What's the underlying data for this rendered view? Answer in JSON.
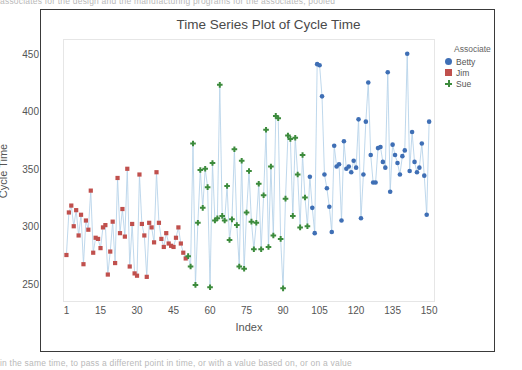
{
  "document": {
    "top_text_fragment": "associates for the design  and the manufacturing  programs  for  the  associates, pooled",
    "bottom_text_fragment": "in the same time,  to pass a different point in time, or with a value based on, or on a value"
  },
  "legend": {
    "title": "Associate",
    "entries": [
      {
        "label": "Betty",
        "color": "#3f6fb5",
        "marker": "circle-marker"
      },
      {
        "label": "Jim",
        "color": "#c0504d",
        "marker": "square-marker"
      },
      {
        "label": "Sue",
        "color": "#3c8b3c",
        "marker": "plus-marker"
      }
    ]
  },
  "chart_data": {
    "type": "line",
    "title": "Time Series Plot of Cycle Time",
    "xlabel": "Index",
    "ylabel": "Cycle Time",
    "xlim": [
      0,
      152
    ],
    "ylim": [
      235,
      462
    ],
    "xticks": [
      1,
      15,
      30,
      45,
      60,
      75,
      90,
      105,
      120,
      135,
      150
    ],
    "yticks": [
      250,
      300,
      350,
      400,
      450
    ],
    "grid": false,
    "legend_position": "right",
    "line_color": "#b8d4ea",
    "series": [
      {
        "name": "Jim",
        "color": "#c0504d",
        "marker": "square-marker",
        "x": [
          1,
          2,
          3,
          4,
          5,
          6,
          7,
          8,
          9,
          10,
          11,
          12,
          13,
          14,
          15,
          16,
          17,
          18,
          19,
          20,
          21,
          22,
          23,
          24,
          25,
          26,
          27,
          28,
          29,
          30,
          31,
          32,
          33,
          34,
          35,
          36,
          37,
          38,
          39,
          40,
          41,
          42,
          43,
          44,
          45,
          46,
          47,
          48,
          49,
          50
        ],
        "y": [
          275,
          312,
          318,
          300,
          314,
          292,
          310,
          267,
          305,
          297,
          331,
          277,
          290,
          289,
          281,
          299,
          301,
          258,
          278,
          304,
          268,
          342,
          294,
          315,
          291,
          350,
          265,
          302,
          259,
          257,
          345,
          302,
          292,
          256,
          303,
          299,
          286,
          347,
          303,
          289,
          282,
          294,
          285,
          283,
          282,
          290,
          299,
          285,
          277,
          272
        ]
      },
      {
        "name": "Sue",
        "color": "#3c8b3c",
        "marker": "plus-marker",
        "x": [
          51,
          52,
          53,
          54,
          55,
          56,
          57,
          58,
          59,
          60,
          61,
          62,
          63,
          64,
          65,
          66,
          67,
          68,
          69,
          70,
          71,
          72,
          73,
          74,
          75,
          76,
          77,
          78,
          79,
          80,
          81,
          82,
          83,
          84,
          85,
          86,
          87,
          88,
          89,
          90,
          91,
          92,
          93,
          94,
          95,
          96,
          97,
          98,
          99,
          100
        ],
        "y": [
          274,
          265,
          372,
          249,
          303,
          349,
          316,
          350,
          334,
          247,
          355,
          305,
          307,
          423,
          309,
          305,
          335,
          288,
          306,
          367,
          301,
          265,
          357,
          263,
          312,
          348,
          304,
          280,
          303,
          337,
          280,
          327,
          384,
          282,
          352,
          292,
          396,
          394,
          289,
          246,
          324,
          379,
          376,
          309,
          377,
          345,
          299,
          362,
          325,
          300
        ]
      },
      {
        "name": "Betty",
        "color": "#3f6fb5",
        "marker": "circle-marker",
        "x": [
          101,
          102,
          103,
          104,
          105,
          106,
          107,
          108,
          109,
          110,
          111,
          112,
          113,
          114,
          115,
          116,
          117,
          118,
          119,
          120,
          121,
          122,
          123,
          124,
          125,
          126,
          127,
          128,
          129,
          130,
          131,
          132,
          133,
          134,
          135,
          136,
          137,
          138,
          139,
          140,
          141,
          142,
          143,
          144,
          145,
          146,
          147,
          148,
          149,
          150
        ],
        "y": [
          343,
          316,
          294,
          441,
          440,
          413,
          345,
          333,
          317,
          295,
          370,
          352,
          354,
          305,
          374,
          350,
          352,
          347,
          357,
          351,
          393,
          307,
          345,
          391,
          425,
          362,
          338,
          338,
          368,
          369,
          356,
          351,
          434,
          330,
          371,
          362,
          355,
          345,
          361,
          366,
          450,
          348,
          382,
          356,
          347,
          351,
          372,
          344,
          310,
          391
        ]
      }
    ]
  }
}
